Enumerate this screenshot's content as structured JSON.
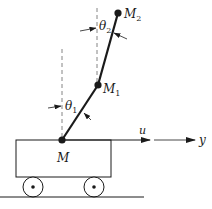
{
  "diagram": {
    "labels": {
      "mass2": "M",
      "mass2_sub": "2",
      "mass1": "M",
      "mass1_sub": "1",
      "cart": "M",
      "theta2": "θ",
      "theta2_sub": "2",
      "theta1": "θ",
      "theta1_sub": "1",
      "force": "u",
      "position": "y"
    },
    "colors": {
      "stroke": "#1a1a1a",
      "dashed": "#777777",
      "background": "#ffffff"
    }
  }
}
